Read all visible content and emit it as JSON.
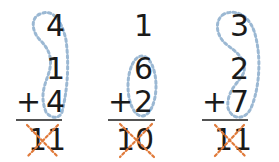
{
  "problems": [
    {
      "addends": [
        "4",
        "1",
        "4"
      ],
      "operator": "+",
      "answer": "11",
      "grouped": "first-and-last",
      "answer_crossed_out": true
    },
    {
      "addends": [
        "1",
        "6",
        "2"
      ],
      "operator": "+",
      "answer": "10",
      "grouped": "middle-and-last",
      "answer_crossed_out": true
    },
    {
      "addends": [
        "3",
        "2",
        "7"
      ],
      "operator": "+",
      "answer": "11",
      "grouped": "first-and-last",
      "answer_crossed_out": true
    }
  ],
  "colors": {
    "grouping_loop": "#9bb8d3",
    "cross_out": "#e07a3a",
    "ink": "#1a1a1a"
  }
}
